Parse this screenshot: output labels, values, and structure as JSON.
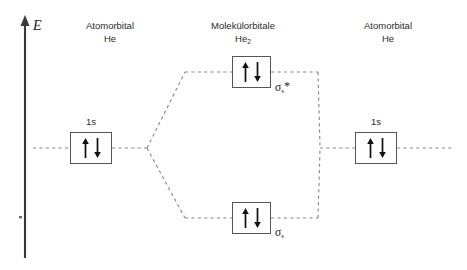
{
  "diagram": {
    "axis": {
      "label": "E",
      "name": "energy-axis"
    },
    "columns": [
      {
        "id": "left-atom",
        "line1": "Atomorbital",
        "line2": "He",
        "sub": ""
      },
      {
        "id": "molecule",
        "line1": "Molekülorbitale",
        "line2": "He",
        "sub": "2"
      },
      {
        "id": "right-atom",
        "line1": "Atomorbital",
        "line2": "He",
        "sub": ""
      }
    ],
    "orbitals": [
      {
        "id": "left-1s",
        "top_label": "1s",
        "mo_label": "",
        "mo_sub": "",
        "star": "",
        "electrons": [
          "up",
          "down"
        ]
      },
      {
        "id": "sigma-antibonding",
        "top_label": "",
        "mo_label": "σ",
        "mo_sub": "s",
        "star": "*",
        "electrons": [
          "up",
          "down"
        ]
      },
      {
        "id": "sigma-bonding",
        "top_label": "",
        "mo_label": "σ",
        "mo_sub": "s",
        "star": "",
        "electrons": [
          "up",
          "down"
        ]
      },
      {
        "id": "right-1s",
        "top_label": "1s",
        "mo_label": "",
        "mo_sub": "",
        "star": "",
        "electrons": [
          "up",
          "down"
        ]
      }
    ],
    "colors": {
      "line": "#555555",
      "dash": "#8a8a8a",
      "text": "#2b2b2b",
      "arrow": "#111111"
    }
  }
}
